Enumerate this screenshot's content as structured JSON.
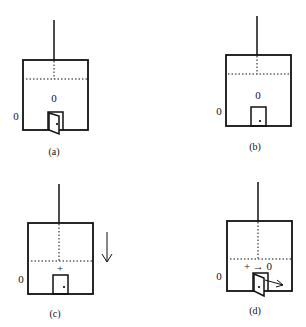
{
  "figure": {
    "panels": [
      {
        "id": "a",
        "caption": "(a)",
        "inside_label": "0",
        "outside_label": "0",
        "door": "open",
        "arrow": ""
      },
      {
        "id": "b",
        "caption": "(b)",
        "inside_label": "0",
        "outside_label": "0",
        "door": "closed",
        "arrow": ""
      },
      {
        "id": "c",
        "caption": "(c)",
        "inside_label": "+",
        "outside_label": "0",
        "door": "closed",
        "arrow": "down"
      },
      {
        "id": "d",
        "caption": "(d)",
        "inside_label": "+ → 0",
        "outside_label": "0",
        "door": "open",
        "arrow": "out-right"
      }
    ]
  }
}
